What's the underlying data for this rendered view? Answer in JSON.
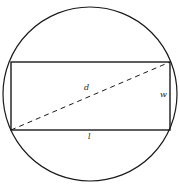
{
  "diagram": {
    "labels": {
      "diagonal": "d",
      "width": "w",
      "length": "l"
    },
    "colors": {
      "stroke": "#1a1a1a",
      "background": "#ffffff"
    }
  }
}
